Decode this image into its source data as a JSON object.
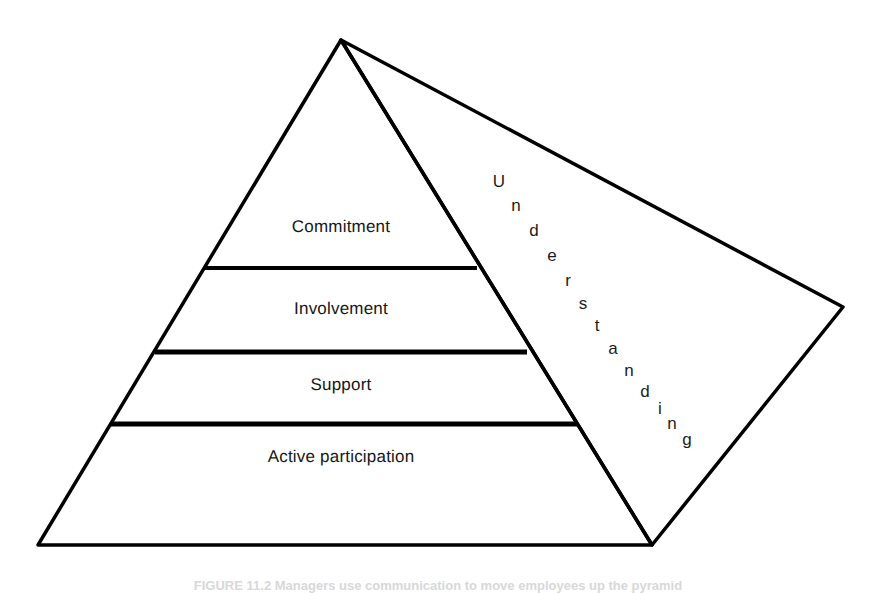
{
  "figure": {
    "caption": "FIGURE 11.2   Managers use communication to move employees up the pyramid",
    "background_color": "#ffffff",
    "line_color": "#000000",
    "text_color": "#161616"
  },
  "pyramid": {
    "apex": {
      "x": 341,
      "y": 40
    },
    "front_bottom_left": {
      "x": 38,
      "y": 545
    },
    "front_bottom_right": {
      "x": 652,
      "y": 545
    },
    "right_vertex": {
      "x": 843,
      "y": 307
    },
    "tiers": [
      {
        "label": "Commitment",
        "level": 4,
        "label_x": 341,
        "label_y": 228,
        "divider_y": 268,
        "divider_x1": 205,
        "divider_x2": 477,
        "divider_weight": 4
      },
      {
        "label": "Involvement",
        "level": 3,
        "label_x": 341,
        "label_y": 310,
        "divider_y": 352,
        "divider_x1": 155,
        "divider_x2": 527,
        "divider_weight": 5
      },
      {
        "label": "Support",
        "level": 2,
        "label_x": 341,
        "label_y": 385,
        "divider_y": 424,
        "divider_x1": 110,
        "divider_x2": 578,
        "divider_weight": 5
      },
      {
        "label": "Active participation",
        "level": 1,
        "label_x": 341,
        "label_y": 457,
        "divider_y": null,
        "divider_x1": null,
        "divider_x2": null,
        "divider_weight": 0
      }
    ]
  },
  "side_face": {
    "word": "Understanding",
    "letters": [
      {
        "char": "U",
        "x": 499,
        "y": 182
      },
      {
        "char": "n",
        "x": 516,
        "y": 206
      },
      {
        "char": "d",
        "x": 534,
        "y": 231
      },
      {
        "char": "e",
        "x": 552,
        "y": 256
      },
      {
        "char": "r",
        "x": 568,
        "y": 281
      },
      {
        "char": "s",
        "x": 583,
        "y": 304
      },
      {
        "char": "t",
        "x": 597,
        "y": 326
      },
      {
        "char": "a",
        "x": 613,
        "y": 349
      },
      {
        "char": "n",
        "x": 629,
        "y": 371
      },
      {
        "char": "d",
        "x": 645,
        "y": 392
      },
      {
        "char": "i",
        "x": 660,
        "y": 409
      },
      {
        "char": "n",
        "x": 672,
        "y": 424
      },
      {
        "char": "g",
        "x": 687,
        "y": 440
      }
    ]
  }
}
